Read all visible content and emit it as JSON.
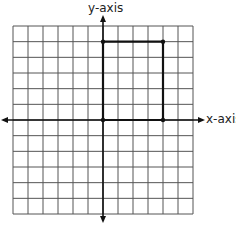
{
  "diagram": {
    "type": "coordinate-grid",
    "x_axis_label": "x-axis",
    "y_axis_label": "y-axis",
    "grid": {
      "columns": 12,
      "rows": 12,
      "x_min": -6,
      "x_max": 6,
      "y_min": -6,
      "y_max": 6
    },
    "shape": {
      "kind": "rectangle",
      "vertices": [
        [
          0,
          0
        ],
        [
          0,
          5
        ],
        [
          4,
          5
        ],
        [
          4,
          0
        ]
      ]
    },
    "colors": {
      "grid": "#555555",
      "axis": "#111111",
      "shape": "#111111",
      "background": "#ffffff"
    }
  },
  "chart_data": {
    "type": "scatter",
    "title": "",
    "xlabel": "x-axis",
    "ylabel": "y-axis",
    "xlim": [
      -6,
      6
    ],
    "ylim": [
      -6,
      6
    ],
    "grid": true,
    "series": [
      {
        "name": "rectangle",
        "x": [
          0,
          0,
          4,
          4
        ],
        "y": [
          0,
          5,
          5,
          0
        ]
      }
    ]
  }
}
